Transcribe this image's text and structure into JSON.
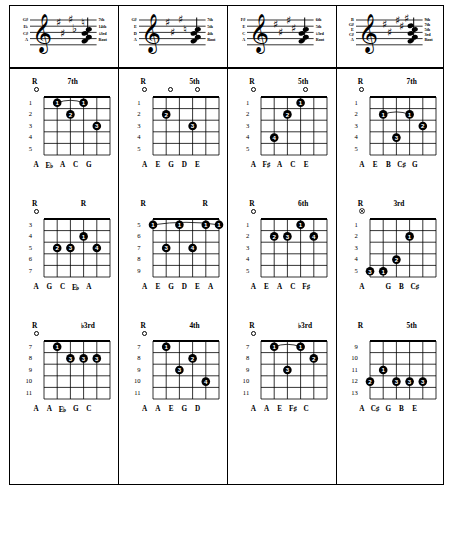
{
  "document": {
    "title": "Guitar Chord Voicings Chart",
    "columns_count": 4,
    "rows_count": 3
  },
  "colors": {
    "ink": "#000000",
    "paper": "#ffffff",
    "staff_line": "#000000"
  },
  "staves": [
    {
      "clef": "treble",
      "left_labels": [
        "G♯",
        "E♭",
        "C♯",
        "A"
      ],
      "right_labels": [
        "7th",
        "14th",
        "♭3rd",
        "Root"
      ],
      "accidental_count": 5
    },
    {
      "clef": "treble",
      "left_labels": [
        "G♯",
        "E",
        "D",
        "A"
      ],
      "right_labels": [
        "7th",
        "5th",
        "4th",
        "Root"
      ],
      "accidental_count": 4
    },
    {
      "clef": "treble",
      "left_labels": [
        "F♯",
        "E",
        "C",
        "A"
      ],
      "right_labels": [
        "6th",
        "5th",
        "♭3rd",
        "Root"
      ],
      "accidental_count": 4
    },
    {
      "clef": "treble",
      "left_labels": [
        "B",
        "G♯",
        "E",
        "C♯",
        "A"
      ],
      "right_labels": [
        "9th",
        "7th",
        "5th",
        "3rd",
        "Root"
      ],
      "accidental_count": 5
    }
  ],
  "diagrams": [
    {
      "id": "chord-r1c1",
      "left_degree": "R",
      "right_degree": "7th",
      "left_degree_string": 2,
      "right_degree_string": 5,
      "fret_numbers": [
        "1",
        "2",
        "3",
        "4",
        "5"
      ],
      "first_fret": 1,
      "fret_count": 5,
      "open_strings": [
        2
      ],
      "muted_strings": [],
      "dots": [
        {
          "string": 3,
          "fret": 1,
          "finger": "1"
        },
        {
          "string": 4,
          "fret": 2,
          "finger": "2"
        },
        {
          "string": 5,
          "fret": 1,
          "finger": "1"
        },
        {
          "string": 6,
          "fret": 3,
          "finger": "3"
        }
      ],
      "tie": {
        "from_string": 3,
        "to_string": 5,
        "fret": 1
      },
      "notes": [
        "A",
        "E♭",
        "A",
        "C",
        "G"
      ],
      "notes_start_string": 2
    },
    {
      "id": "chord-r1c2",
      "left_degree": "R",
      "right_degree": "5th",
      "left_degree_string": 2,
      "right_degree_string": 6,
      "fret_numbers": [
        "1",
        "2",
        "3",
        "4",
        "5"
      ],
      "first_fret": 1,
      "fret_count": 5,
      "open_strings": [
        2,
        4,
        6
      ],
      "muted_strings": [],
      "dots": [
        {
          "string": 3,
          "fret": 2,
          "finger": "2"
        },
        {
          "string": 5,
          "fret": 3,
          "finger": "3"
        }
      ],
      "tie": null,
      "notes": [
        "A",
        "E",
        "G",
        "D",
        "E"
      ],
      "notes_start_string": 2
    },
    {
      "id": "chord-r1c3",
      "left_degree": "R",
      "right_degree": "5th",
      "left_degree_string": 2,
      "right_degree_string": 6,
      "fret_numbers": [
        "1",
        "2",
        "3",
        "4",
        "5"
      ],
      "first_fret": 1,
      "fret_count": 5,
      "open_strings": [
        2,
        6
      ],
      "muted_strings": [],
      "dots": [
        {
          "string": 3,
          "fret": 4,
          "finger": "4"
        },
        {
          "string": 4,
          "fret": 2,
          "finger": "2"
        },
        {
          "string": 5,
          "fret": 1,
          "finger": "1"
        }
      ],
      "tie": null,
      "notes": [
        "A",
        "F♯",
        "A",
        "C",
        "E"
      ],
      "notes_start_string": 2
    },
    {
      "id": "chord-r1c4",
      "left_degree": "R",
      "right_degree": "7th",
      "left_degree_string": 2,
      "right_degree_string": 6,
      "fret_numbers": [
        "1",
        "2",
        "3",
        "4",
        "5"
      ],
      "first_fret": 1,
      "fret_count": 5,
      "open_strings": [
        2
      ],
      "muted_strings": [],
      "dots": [
        {
          "string": 3,
          "fret": 2,
          "finger": "1"
        },
        {
          "string": 4,
          "fret": 4,
          "finger": "3"
        },
        {
          "string": 5,
          "fret": 2,
          "finger": "1"
        },
        {
          "string": 6,
          "fret": 3,
          "finger": "2"
        }
      ],
      "tie": {
        "from_string": 3,
        "to_string": 5,
        "fret": 2
      },
      "notes": [
        "A",
        "E",
        "B",
        "C♯",
        "G"
      ],
      "notes_start_string": 2
    },
    {
      "id": "chord-r2c1",
      "left_degree": "R",
      "right_degree": "R",
      "left_degree_string": 2,
      "right_degree_string": 6,
      "fret_numbers": [
        "3",
        "4",
        "5",
        "6",
        "7"
      ],
      "first_fret": 3,
      "fret_count": 5,
      "open_strings": [
        2
      ],
      "muted_strings": [],
      "dots": [
        {
          "string": 3,
          "fret": 5,
          "finger": "2"
        },
        {
          "string": 4,
          "fret": 5,
          "finger": "3"
        },
        {
          "string": 5,
          "fret": 4,
          "finger": "1"
        },
        {
          "string": 6,
          "fret": 5,
          "finger": "4"
        }
      ],
      "tie": null,
      "notes": [
        "A",
        "G",
        "C",
        "E♭",
        "A"
      ],
      "notes_start_string": 2
    },
    {
      "id": "chord-r2c2",
      "left_degree": "R",
      "right_degree": "R",
      "left_degree_string": 2,
      "right_degree_string": 7,
      "fret_numbers": [
        "5",
        "6",
        "7",
        "8",
        "9"
      ],
      "first_fret": 5,
      "fret_count": 5,
      "open_strings": [],
      "muted_strings": [],
      "barre": {
        "fret": 5,
        "from_string": 2,
        "to_string": 7,
        "finger": "1"
      },
      "dots": [
        {
          "string": 2,
          "fret": 5,
          "finger": "1"
        },
        {
          "string": 3,
          "fret": 7,
          "finger": "3"
        },
        {
          "string": 4,
          "fret": 5,
          "finger": "1"
        },
        {
          "string": 5,
          "fret": 7,
          "finger": "4"
        },
        {
          "string": 6,
          "fret": 5,
          "finger": "1"
        },
        {
          "string": 7,
          "fret": 5,
          "finger": "1"
        }
      ],
      "tie": {
        "from_string": 2,
        "to_string": 7,
        "fret": 5
      },
      "notes": [
        "A",
        "E",
        "G",
        "D",
        "E",
        "A"
      ],
      "notes_start_string": 2
    },
    {
      "id": "chord-r2c3",
      "left_degree": "R",
      "right_degree": "6th",
      "left_degree_string": 2,
      "right_degree_string": 6,
      "fret_numbers": [
        "1",
        "2",
        "3",
        "4",
        "5"
      ],
      "first_fret": 1,
      "fret_count": 5,
      "open_strings": [
        2
      ],
      "muted_strings": [],
      "dots": [
        {
          "string": 3,
          "fret": 2,
          "finger": "2"
        },
        {
          "string": 4,
          "fret": 2,
          "finger": "3"
        },
        {
          "string": 5,
          "fret": 1,
          "finger": "1"
        },
        {
          "string": 6,
          "fret": 2,
          "finger": "4"
        }
      ],
      "tie": null,
      "notes": [
        "A",
        "E",
        "A",
        "C",
        "F♯"
      ],
      "notes_start_string": 2
    },
    {
      "id": "chord-r2c4",
      "left_degree": "R",
      "right_degree": "3rd",
      "left_degree_string": 2,
      "right_degree_string": 5,
      "fret_numbers": [
        "1",
        "2",
        "3",
        "4",
        "5"
      ],
      "first_fret": 1,
      "fret_count": 5,
      "open_strings": [],
      "muted_strings": [
        2
      ],
      "dots": [
        {
          "string": 2,
          "fret": 5,
          "finger": "3"
        },
        {
          "string": 3,
          "fret": 5,
          "finger": "1"
        },
        {
          "string": 4,
          "fret": 4,
          "finger": "2"
        },
        {
          "string": 5,
          "fret": 2,
          "finger": "1"
        }
      ],
      "tie": null,
      "notes": [
        "A",
        "",
        "G",
        "B",
        "C♯"
      ],
      "notes_start_string": 2
    },
    {
      "id": "chord-r3c1",
      "left_degree": "R",
      "right_degree": "♭3rd",
      "left_degree_string": 2,
      "right_degree_string": 6,
      "fret_numbers": [
        "7",
        "8",
        "9",
        "10",
        "11"
      ],
      "first_fret": 7,
      "fret_count": 5,
      "open_strings": [
        2
      ],
      "muted_strings": [],
      "dots": [
        {
          "string": 3,
          "fret": 7,
          "finger": "1"
        },
        {
          "string": 4,
          "fret": 8,
          "finger": "3"
        },
        {
          "string": 5,
          "fret": 8,
          "finger": "3"
        },
        {
          "string": 6,
          "fret": 8,
          "finger": "3"
        }
      ],
      "tie": null,
      "notes": [
        "A",
        "A",
        "E♭",
        "G",
        "C"
      ],
      "notes_start_string": 2
    },
    {
      "id": "chord-r3c2",
      "left_degree": "R",
      "right_degree": "4th",
      "left_degree_string": 2,
      "right_degree_string": 6,
      "fret_numbers": [
        "7",
        "8",
        "9",
        "10",
        "11"
      ],
      "first_fret": 7,
      "fret_count": 5,
      "open_strings": [
        2
      ],
      "muted_strings": [],
      "dots": [
        {
          "string": 3,
          "fret": 7,
          "finger": "1"
        },
        {
          "string": 4,
          "fret": 9,
          "finger": "3"
        },
        {
          "string": 5,
          "fret": 8,
          "finger": "2"
        },
        {
          "string": 6,
          "fret": 10,
          "finger": "4"
        }
      ],
      "tie": null,
      "notes": [
        "A",
        "A",
        "E",
        "G",
        "D"
      ],
      "notes_start_string": 2
    },
    {
      "id": "chord-r3c3",
      "left_degree": "R",
      "right_degree": "♭3rd",
      "left_degree_string": 2,
      "right_degree_string": 6,
      "fret_numbers": [
        "7",
        "8",
        "9",
        "10",
        "11"
      ],
      "first_fret": 7,
      "fret_count": 5,
      "open_strings": [
        2
      ],
      "muted_strings": [],
      "dots": [
        {
          "string": 3,
          "fret": 7,
          "finger": "1"
        },
        {
          "string": 4,
          "fret": 9,
          "finger": "3"
        },
        {
          "string": 5,
          "fret": 7,
          "finger": "1"
        },
        {
          "string": 6,
          "fret": 8,
          "finger": "2"
        }
      ],
      "tie": {
        "from_string": 3,
        "to_string": 5,
        "fret": 7
      },
      "notes": [
        "A",
        "A",
        "E",
        "F♯",
        "C"
      ],
      "notes_start_string": 2
    },
    {
      "id": "chord-r3c4",
      "left_degree": "R",
      "right_degree": "5th",
      "left_degree_string": 2,
      "right_degree_string": 6,
      "fret_numbers": [
        "9",
        "10",
        "11",
        "12",
        "13"
      ],
      "first_fret": 9,
      "fret_count": 5,
      "open_strings": [],
      "muted_strings": [],
      "dots": [
        {
          "string": 2,
          "fret": 12,
          "finger": "2"
        },
        {
          "string": 3,
          "fret": 11,
          "finger": "1"
        },
        {
          "string": 4,
          "fret": 12,
          "finger": "3"
        },
        {
          "string": 5,
          "fret": 12,
          "finger": "3"
        },
        {
          "string": 6,
          "fret": 12,
          "finger": "3"
        }
      ],
      "tie": null,
      "notes": [
        "A",
        "C♯",
        "G",
        "B",
        "E"
      ],
      "notes_start_string": 2
    }
  ]
}
